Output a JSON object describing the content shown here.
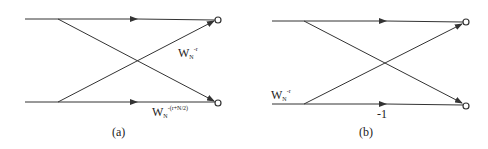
{
  "diagrams": [
    {
      "caption": "(a)",
      "labels": {
        "upper": {
          "base": "W",
          "sub": "N",
          "sup": "-r"
        },
        "lower": {
          "base": "W",
          "sub": "N",
          "sup": "-(r+N/2)"
        }
      }
    },
    {
      "caption": "(b)",
      "labels": {
        "input": {
          "base": "W",
          "sub": "N",
          "sup": "-r"
        },
        "minus_one": "-1"
      }
    }
  ],
  "colors": {
    "line": "#333333",
    "text": "#222222",
    "background": "#ffffff"
  }
}
